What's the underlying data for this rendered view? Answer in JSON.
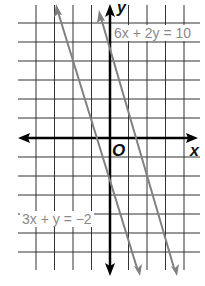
{
  "graph": {
    "type": "coordinate-plane",
    "axes": {
      "x_label": "x",
      "y_label": "y",
      "origin_label": "O"
    },
    "grid": {
      "x_min": -5,
      "x_max": 4,
      "y_min": -6,
      "y_max": 6,
      "unit_px": 18.5
    },
    "colors": {
      "grid": "#222222",
      "axis": "#000000",
      "lines": "#808080",
      "label_text": "#8a8a8a"
    },
    "lines": [
      {
        "equation": "6x + 2y = 10",
        "label": "6x + 2y = 10",
        "slope": -3,
        "intercept": 5
      },
      {
        "equation": "3x + y = −2",
        "label": "3x + y = −2",
        "slope": -3,
        "intercept": -2
      }
    ]
  }
}
